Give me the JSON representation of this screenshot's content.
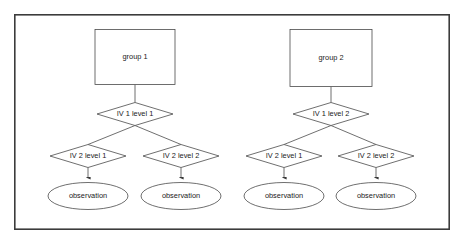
{
  "diagram": {
    "frame": {
      "x": 14,
      "y": 14,
      "width": 436,
      "height": 216,
      "stroke": "#3c3c3c"
    },
    "colors": {
      "background": "#ffffff",
      "shape_stroke": "#4a4a4a",
      "shape_fill": "#ffffff",
      "text": "#1b1b1b",
      "arrow": "#3a3a3a",
      "frame": "#3c3c3c"
    },
    "branches": [
      {
        "id": "branch-1",
        "group": {
          "label": "group 1",
          "shape": "rectangle",
          "cx": 135,
          "cy": 57,
          "width": 80,
          "height": 55
        },
        "iv1": {
          "label": "IV 1 level 1",
          "shape": "diamond",
          "cx": 135,
          "cy": 114,
          "width": 76,
          "height": 23
        },
        "children": [
          {
            "iv2": {
              "label": "IV 2 level 1",
              "shape": "diamond",
              "cx": 88,
              "cy": 156,
              "width": 76,
              "height": 23
            },
            "observation": {
              "label": "observation",
              "shape": "ellipse",
              "cx": 88,
              "cy": 196,
              "width": 80,
              "height": 27
            }
          },
          {
            "iv2": {
              "label": "IV 2 level 2",
              "shape": "diamond",
              "cx": 181,
              "cy": 156,
              "width": 76,
              "height": 23
            },
            "observation": {
              "label": "observation",
              "shape": "ellipse",
              "cx": 181,
              "cy": 196,
              "width": 80,
              "height": 27
            }
          }
        ]
      },
      {
        "id": "branch-2",
        "group": {
          "label": "group 2",
          "shape": "rectangle",
          "cx": 331,
          "cy": 58,
          "width": 82,
          "height": 57
        },
        "iv1": {
          "label": "IV 1 level 2",
          "shape": "diamond",
          "cx": 331,
          "cy": 114,
          "width": 76,
          "height": 23
        },
        "children": [
          {
            "iv2": {
              "label": "IV 2 level 1",
              "shape": "diamond",
              "cx": 284,
              "cy": 156,
              "width": 76,
              "height": 23
            },
            "observation": {
              "label": "observation",
              "shape": "ellipse",
              "cx": 284,
              "cy": 196,
              "width": 80,
              "height": 27
            }
          },
          {
            "iv2": {
              "label": "IV 2 level 2",
              "shape": "diamond",
              "cx": 376,
              "cy": 156,
              "width": 76,
              "height": 23
            },
            "observation": {
              "label": "observation",
              "shape": "ellipse",
              "cx": 376,
              "cy": 196,
              "width": 80,
              "height": 27
            }
          }
        ]
      }
    ]
  }
}
